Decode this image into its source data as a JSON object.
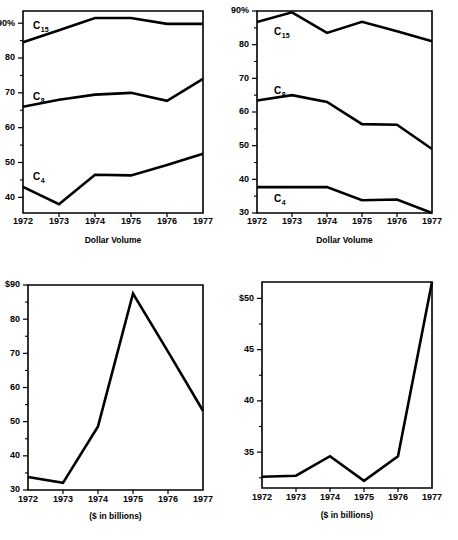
{
  "page": {
    "background": "#ffffff",
    "ink": "#000000"
  },
  "charts": [
    {
      "id": "top-left",
      "name": "dollar-volume-concentration-ratios-chart-1",
      "xlabel": "Dollar Volume",
      "ylabel": "",
      "x_ticks": [
        "1972",
        "1973",
        "1974",
        "1975",
        "1976",
        "1977"
      ],
      "y_ticks": [
        "90%",
        "80",
        "70",
        "60",
        "50",
        "40"
      ],
      "series_labels": [
        "C",
        "C",
        "C"
      ],
      "series_subs": [
        "15",
        "8",
        "4"
      ]
    },
    {
      "id": "top-right",
      "name": "dollar-volume-concentration-ratios-chart-2",
      "xlabel": "Dollar Volume",
      "ylabel": "",
      "x_ticks": [
        "1972",
        "1973",
        "1974",
        "1975",
        "1976",
        "1977"
      ],
      "y_ticks": [
        "90%",
        "80",
        "70",
        "60",
        "50",
        "40",
        "30"
      ],
      "series_labels": [
        "C",
        "C",
        "C"
      ],
      "series_subs": [
        "15",
        "8",
        "4"
      ]
    },
    {
      "id": "bottom-left",
      "name": "dollar-volume-total-chart-1",
      "xlabel": "($ in billions)",
      "ylabel": "",
      "x_ticks": [
        "1972",
        "1973",
        "1974",
        "1975",
        "1976",
        "1977"
      ],
      "y_ticks": [
        "$90",
        "80",
        "70",
        "60",
        "50",
        "40",
        "30"
      ]
    },
    {
      "id": "bottom-right",
      "name": "dollar-volume-total-chart-2",
      "xlabel": "($ in billions)",
      "ylabel": "",
      "x_ticks": [
        "1972",
        "1973",
        "1974",
        "1975",
        "1976",
        "1977"
      ],
      "y_ticks": [
        "$50",
        "45",
        "40",
        "35"
      ]
    }
  ],
  "chart_data": [
    {
      "type": "line",
      "id": "top-left",
      "title": "",
      "xlabel": "Dollar Volume",
      "ylabel": "",
      "x": [
        1972,
        1973,
        1974,
        1975,
        1976,
        1977
      ],
      "xtick_labels": [
        "1972",
        "1973",
        "1974",
        "1975",
        "1976",
        "1977"
      ],
      "ytick_labels": [
        "90%",
        "80",
        "70",
        "60",
        "50",
        "40"
      ],
      "ytick_values": [
        90,
        80,
        70,
        60,
        50,
        40
      ],
      "ylim": [
        35.5,
        93.5
      ],
      "grid": false,
      "legend": "inline-labels",
      "series": [
        {
          "name": "C15",
          "label": "C",
          "sub": "15",
          "values": [
            84.5,
            88.0,
            91.5,
            91.5,
            89.8,
            89.8
          ]
        },
        {
          "name": "C8",
          "label": "C",
          "sub": "8",
          "values": [
            66.0,
            68.0,
            69.5,
            70.0,
            67.7,
            74.0
          ]
        },
        {
          "name": "C4",
          "label": "C",
          "sub": "4",
          "values": [
            43.0,
            38.0,
            46.5,
            46.3,
            49.3,
            52.5
          ]
        }
      ]
    },
    {
      "type": "line",
      "id": "top-right",
      "title": "",
      "xlabel": "Dollar Volume",
      "ylabel": "",
      "x": [
        1972,
        1973,
        1974,
        1975,
        1976,
        1977
      ],
      "xtick_labels": [
        "1972",
        "1973",
        "1974",
        "1975",
        "1976",
        "1977"
      ],
      "ytick_labels": [
        "90%",
        "80",
        "70",
        "60",
        "50",
        "40",
        "30"
      ],
      "ytick_values": [
        90,
        80,
        70,
        60,
        50,
        40,
        30
      ],
      "ylim": [
        30,
        90
      ],
      "grid": false,
      "legend": "inline-labels",
      "series": [
        {
          "name": "C15",
          "label": "C",
          "sub": "15",
          "values": [
            86.7,
            89.6,
            83.5,
            86.8,
            84.0,
            81.0
          ]
        },
        {
          "name": "C8",
          "label": "C",
          "sub": "8",
          "values": [
            63.4,
            65.0,
            63.0,
            56.4,
            56.2,
            49.0
          ]
        },
        {
          "name": "C4",
          "label": "C",
          "sub": "4",
          "values": [
            37.7,
            37.7,
            37.7,
            33.8,
            34.0,
            30.0
          ]
        }
      ]
    },
    {
      "type": "line",
      "id": "bottom-left",
      "title": "",
      "xlabel": "($ in billions)",
      "ylabel": "",
      "x": [
        1972,
        1973,
        1974,
        1975,
        1976,
        1977
      ],
      "xtick_labels": [
        "1972",
        "1973",
        "1974",
        "1975",
        "1976",
        "1977"
      ],
      "ytick_labels": [
        "$90",
        "80",
        "70",
        "60",
        "50",
        "40",
        "30"
      ],
      "ytick_values": [
        90,
        80,
        70,
        60,
        50,
        40,
        30
      ],
      "ylim": [
        30,
        90
      ],
      "grid": false,
      "series": [
        {
          "name": "total-dollar-volume",
          "values": [
            33.8,
            32.1,
            48.6,
            87.5,
            70.5,
            53.2
          ]
        }
      ]
    },
    {
      "type": "line",
      "id": "bottom-right",
      "title": "",
      "xlabel": "($ in billions)",
      "ylabel": "",
      "x": [
        1972,
        1973,
        1974,
        1975,
        1976,
        1977
      ],
      "xtick_labels": [
        "1972",
        "1973",
        "1974",
        "1975",
        "1976",
        "1977"
      ],
      "ytick_labels": [
        "$50",
        "45",
        "40",
        "35"
      ],
      "ytick_values": [
        50,
        45,
        40,
        35
      ],
      "ylim": [
        31.5,
        51.6
      ],
      "grid": false,
      "series": [
        {
          "name": "total-dollar-volume",
          "values": [
            32.6,
            32.7,
            34.6,
            32.2,
            34.6,
            51.6
          ]
        }
      ]
    }
  ]
}
